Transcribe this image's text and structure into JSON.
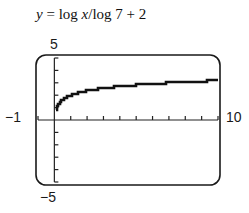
{
  "chart_data": {
    "type": "line",
    "title": "y = log x/log 7 + 2",
    "function": "y = log(x)/log(7) + 2",
    "xlabel": "",
    "ylabel": "",
    "xlim": [
      -1,
      10
    ],
    "ylim": [
      -5,
      5
    ],
    "x_tick_step": 1,
    "y_tick_step": 1,
    "grid": false,
    "window_labels": {
      "xmin": "−1",
      "xmax": "10",
      "ymin": "−5",
      "ymax": "5"
    },
    "x": [
      0.05,
      0.1,
      0.25,
      0.5,
      1,
      2,
      3,
      4,
      5,
      6,
      7,
      8,
      9,
      10
    ],
    "y": [
      0.46,
      0.82,
      1.29,
      1.64,
      2.0,
      2.36,
      2.56,
      2.71,
      2.83,
      2.92,
      3.0,
      3.07,
      3.13,
      3.18
    ]
  },
  "title_parts": {
    "y": "y",
    "eq": " = log ",
    "x": "x",
    "rest": "/log 7 + 2"
  }
}
